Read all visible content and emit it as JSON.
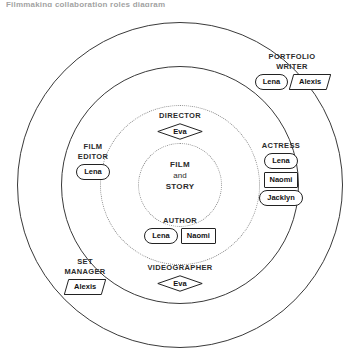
{
  "header": {
    "clipped_text": "Filmmaking collaboration roles diagram"
  },
  "diagram": {
    "type": "concentric-rings",
    "core": {
      "line1": "FILM",
      "line2": "and",
      "line3": "STORY"
    },
    "rings": [
      {
        "name": "outer-ring",
        "style": "solid"
      },
      {
        "name": "second-ring",
        "style": "solid"
      },
      {
        "name": "middle-dotted-ring",
        "style": "dotted"
      },
      {
        "name": "inner-dotted-ring",
        "style": "dotted"
      }
    ],
    "groups": [
      {
        "id": "director",
        "label": "DIRECTOR",
        "ring": "middle-dotted-ring",
        "position": "top",
        "nodes": [
          {
            "name": "Eva",
            "shape": "hexagon"
          }
        ]
      },
      {
        "id": "author",
        "label": "AUTHOR",
        "ring": "middle-dotted-ring",
        "position": "bottom",
        "nodes": [
          {
            "name": "Lena",
            "shape": "pill"
          },
          {
            "name": "Naomi",
            "shape": "rect"
          }
        ]
      },
      {
        "id": "film-editor",
        "label_line1": "FILM",
        "label_line2": "EDITOR",
        "ring": "second-ring",
        "position": "left",
        "nodes": [
          {
            "name": "Lena",
            "shape": "pill"
          }
        ]
      },
      {
        "id": "actress",
        "label": "ACTRESS",
        "ring": "second-ring",
        "position": "right",
        "nodes": [
          {
            "name": "Lena",
            "shape": "pill"
          },
          {
            "name": "Naomi",
            "shape": "rect"
          },
          {
            "name": "Jacklyn",
            "shape": "pill"
          }
        ]
      },
      {
        "id": "videographer",
        "label": "VIDEOGRAPHER",
        "ring": "second-ring",
        "position": "bottom",
        "nodes": [
          {
            "name": "Eva",
            "shape": "hexagon"
          }
        ]
      },
      {
        "id": "portfolio-writer",
        "label_line1": "PORTFOLIO",
        "label_line2": "WRITER",
        "ring": "outer-ring",
        "position": "top-right",
        "nodes": [
          {
            "name": "Lena",
            "shape": "pill"
          },
          {
            "name": "Alexis",
            "shape": "parallelogram"
          }
        ]
      },
      {
        "id": "set-manager",
        "label_line1": "SET",
        "label_line2": "MANAGER",
        "ring": "outer-ring",
        "position": "bottom-left",
        "nodes": [
          {
            "name": "Alexis",
            "shape": "parallelogram"
          }
        ]
      }
    ]
  },
  "colors": {
    "stroke_solid": "#3a3a3a",
    "stroke_dotted": "#8a8a8a",
    "text": "#1a1a1a",
    "background": "#ffffff"
  }
}
